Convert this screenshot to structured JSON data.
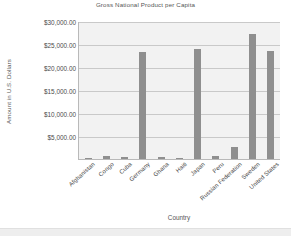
{
  "chart_data": {
    "type": "bar",
    "title": "Gross National Product per Capita",
    "xlabel": "Country",
    "ylabel": "Amount in U.S. Dollars",
    "categories": [
      "Afghanistan",
      "Congo",
      "Cuba",
      "Germany",
      "Ghana",
      "Haiti",
      "Japan",
      "Peru",
      "Russian Federation",
      "Sweden",
      "United States"
    ],
    "values": [
      200,
      640,
      540,
      23200,
      390,
      300,
      23900,
      730,
      2700,
      27200,
      23400
    ],
    "ytick_labels": [
      "$30,000.00",
      "$25,000.00",
      "$20,000.00",
      "$15,000.00",
      "$10,000.00",
      "$5,000.00"
    ],
    "ytick_values": [
      30000,
      25000,
      20000,
      15000,
      10000,
      5000
    ],
    "ylim": [
      0,
      30000
    ],
    "grid": true,
    "legend": "none",
    "bar_color": "#8f8f8f",
    "plot_background": "#f2f2f2",
    "gridline_color": "#c9c9c9"
  }
}
